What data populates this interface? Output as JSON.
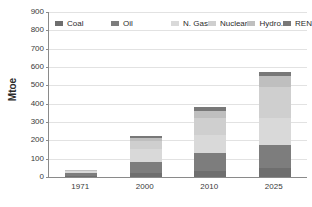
{
  "chart_data": {
    "type": "bar",
    "stacked": true,
    "title": "",
    "xlabel": "",
    "ylabel": "Mtoe",
    "categories": [
      "1971",
      "2000",
      "2010",
      "2025"
    ],
    "ylim": [
      0,
      900
    ],
    "ytick_step": 100,
    "yticks": [
      "900",
      "800",
      "700",
      "600",
      "500",
      "400",
      "300",
      "200",
      "100",
      "0"
    ],
    "grid": true,
    "legend_position": "top-left",
    "series": [
      {
        "name": "Coal",
        "color": "#6e6e6e",
        "values": [
          6,
          22,
          34,
          48
        ]
      },
      {
        "name": "Oil",
        "color": "#7d7d7d",
        "values": [
          18,
          62,
          96,
          128
        ]
      },
      {
        "name": "N. Gas",
        "color": "#d9d9d9",
        "values": [
          10,
          68,
          102,
          148
        ]
      },
      {
        "name": "Nuclear",
        "color": "#cfcfcf",
        "values": [
          0,
          44,
          92,
          168
        ]
      },
      {
        "name": "Hydro.",
        "color": "#bfbfbf",
        "values": [
          4,
          18,
          38,
          58
        ]
      },
      {
        "name": "REN",
        "color": "#787878",
        "values": [
          2,
          8,
          22,
          22
        ]
      }
    ],
    "totals": [
      40,
      222,
      384,
      572
    ]
  }
}
